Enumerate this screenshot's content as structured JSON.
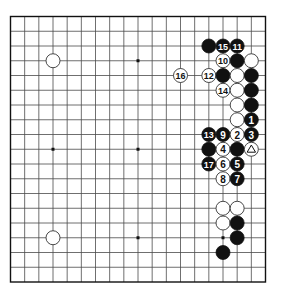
{
  "diagram": {
    "type": "go-board",
    "board_size": 19,
    "hoshi": [
      [
        3,
        3
      ],
      [
        9,
        3
      ],
      [
        15,
        3
      ],
      [
        3,
        9
      ],
      [
        9,
        9
      ],
      [
        15,
        9
      ],
      [
        3,
        15
      ],
      [
        9,
        15
      ],
      [
        15,
        15
      ]
    ],
    "stones": [
      {
        "color": "white",
        "col": 3,
        "row": 3,
        "label": ""
      },
      {
        "color": "white",
        "col": 3,
        "row": 15,
        "label": ""
      },
      {
        "color": "black",
        "col": 14,
        "row": 2,
        "label": ""
      },
      {
        "color": "black",
        "col": 15,
        "row": 2,
        "label": "15"
      },
      {
        "color": "black",
        "col": 16,
        "row": 2,
        "label": "11"
      },
      {
        "color": "white",
        "col": 15,
        "row": 3,
        "label": "10"
      },
      {
        "color": "black",
        "col": 16,
        "row": 3,
        "label": ""
      },
      {
        "color": "white",
        "col": 17,
        "row": 3,
        "label": ""
      },
      {
        "color": "white",
        "col": 12,
        "row": 4,
        "label": "16"
      },
      {
        "color": "white",
        "col": 14,
        "row": 4,
        "label": "12"
      },
      {
        "color": "black",
        "col": 15,
        "row": 4,
        "label": ""
      },
      {
        "color": "white",
        "col": 16,
        "row": 4,
        "label": ""
      },
      {
        "color": "black",
        "col": 17,
        "row": 4,
        "label": ""
      },
      {
        "color": "white",
        "col": 15,
        "row": 5,
        "label": "14"
      },
      {
        "color": "white",
        "col": 16,
        "row": 5,
        "label": ""
      },
      {
        "color": "black",
        "col": 17,
        "row": 5,
        "label": ""
      },
      {
        "color": "white",
        "col": 16,
        "row": 6,
        "label": ""
      },
      {
        "color": "black",
        "col": 17,
        "row": 6,
        "label": ""
      },
      {
        "color": "white",
        "col": 16,
        "row": 7,
        "label": ""
      },
      {
        "color": "black",
        "col": 17,
        "row": 7,
        "label": "1"
      },
      {
        "color": "black",
        "col": 14,
        "row": 8,
        "label": "13"
      },
      {
        "color": "black",
        "col": 15,
        "row": 8,
        "label": "9"
      },
      {
        "color": "white",
        "col": 16,
        "row": 8,
        "label": "2"
      },
      {
        "color": "black",
        "col": 17,
        "row": 8,
        "label": "3"
      },
      {
        "color": "black",
        "col": 14,
        "row": 9,
        "label": ""
      },
      {
        "color": "white",
        "col": 15,
        "row": 9,
        "label": "4"
      },
      {
        "color": "black",
        "col": 16,
        "row": 9,
        "label": ""
      },
      {
        "color": "white",
        "col": 17,
        "row": 9,
        "label": "",
        "marker": "triangle"
      },
      {
        "color": "black",
        "col": 14,
        "row": 10,
        "label": "17"
      },
      {
        "color": "white",
        "col": 15,
        "row": 10,
        "label": "6"
      },
      {
        "color": "black",
        "col": 16,
        "row": 10,
        "label": "5"
      },
      {
        "color": "white",
        "col": 15,
        "row": 11,
        "label": "8"
      },
      {
        "color": "black",
        "col": 16,
        "row": 11,
        "label": "7"
      },
      {
        "color": "white",
        "col": 15,
        "row": 13,
        "label": ""
      },
      {
        "color": "white",
        "col": 16,
        "row": 13,
        "label": ""
      },
      {
        "color": "white",
        "col": 15,
        "row": 14,
        "label": ""
      },
      {
        "color": "black",
        "col": 16,
        "row": 14,
        "label": ""
      },
      {
        "color": "black",
        "col": 16,
        "row": 15,
        "label": ""
      },
      {
        "color": "black",
        "col": 15,
        "row": 16,
        "label": ""
      }
    ]
  }
}
